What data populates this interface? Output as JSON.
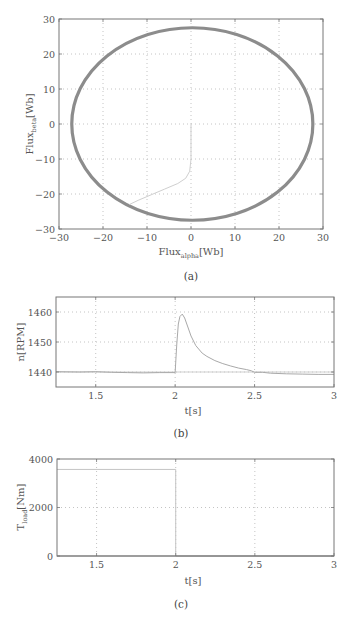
{
  "chart_data": [
    {
      "id": "a",
      "type": "line",
      "subplot_label": "(a)",
      "title": "",
      "xlabel": "Flux",
      "xlabel_sub": "alpha",
      "xlabel_unit": "[Wb]",
      "ylabel": "Flux",
      "ylabel_sub": "beta",
      "ylabel_unit": "[Wb]",
      "xlim": [
        -30,
        30
      ],
      "ylim": [
        -30,
        30
      ],
      "xticks": [
        -30,
        -20,
        -10,
        0,
        10,
        20,
        30
      ],
      "yticks": [
        -30,
        -20,
        -10,
        0,
        10,
        20,
        30
      ],
      "grid": true,
      "series": [
        {
          "name": "steady-state flux circle",
          "kind": "ellipse",
          "center": [
            0.3,
            0
          ],
          "radius_x": 27.4,
          "radius_y": 27.5,
          "color": "#8c8c8c",
          "width": 3.2
        },
        {
          "name": "startup flux trajectory",
          "kind": "polyline",
          "x": [
            0,
            0,
            -0.3,
            -1.2,
            -3,
            -6,
            -9,
            -12,
            -14
          ],
          "y": [
            0,
            -10,
            -13.5,
            -15.5,
            -17,
            -18.6,
            -20.2,
            -21.8,
            -23
          ],
          "color": "#cfcfcf",
          "width": 1
        }
      ]
    },
    {
      "id": "b",
      "type": "line",
      "subplot_label": "(b)",
      "title": "",
      "xlabel": "t[s]",
      "ylabel": "n[RPM]",
      "xlim": [
        1.25,
        3
      ],
      "ylim": [
        1435,
        1465
      ],
      "xticks": [
        1.5,
        2,
        2.5,
        3
      ],
      "yticks": [
        1440,
        1450,
        1460
      ],
      "grid": true,
      "series": [
        {
          "name": "reference speed",
          "x": [
            1.25,
            3
          ],
          "y": [
            1440,
            1440
          ],
          "color": "#cfcfcf",
          "width": 1
        },
        {
          "name": "measured speed",
          "x": [
            1.25,
            1.4,
            1.5,
            1.6,
            1.7,
            1.8,
            1.9,
            2.0,
            2.01,
            2.02,
            2.03,
            2.045,
            2.06,
            2.08,
            2.1,
            2.13,
            2.17,
            2.2,
            2.25,
            2.3,
            2.35,
            2.4,
            2.45,
            2.48,
            2.5,
            2.55,
            2.6,
            2.7,
            2.8,
            2.9,
            3.0
          ],
          "y": [
            1440.1,
            1440,
            1440.1,
            1439.9,
            1439.8,
            1439.7,
            1439.8,
            1439.8,
            1449,
            1456,
            1458.5,
            1459.3,
            1458,
            1455,
            1452,
            1448.8,
            1446.3,
            1445.2,
            1443.8,
            1442.8,
            1442,
            1441.3,
            1440.8,
            1440.4,
            1439.9,
            1439.9,
            1439.6,
            1439.4,
            1439.3,
            1439.2,
            1439.2
          ],
          "color": "#a9a9a9",
          "width": 1
        }
      ]
    },
    {
      "id": "c",
      "type": "line",
      "subplot_label": "(c)",
      "title": "",
      "xlabel": "t[s]",
      "ylabel": "T",
      "ylabel_sub": "load",
      "ylabel_unit": "[Nm]",
      "xlim": [
        1.25,
        3
      ],
      "ylim": [
        0,
        4000
      ],
      "xticks": [
        1.5,
        2,
        2.5,
        3
      ],
      "yticks": [
        0,
        2000,
        4000
      ],
      "grid": true,
      "series": [
        {
          "name": "load torque",
          "x": [
            1.25,
            2.0,
            2.0,
            3.0
          ],
          "y": [
            3570,
            3570,
            0,
            0
          ],
          "color": "#c4c4c4",
          "width": 1
        },
        {
          "name": "load torque (zero trace)",
          "x": [
            1.25,
            3.0
          ],
          "y": [
            0,
            0
          ],
          "color": "#8a8a8a",
          "width": 1.2
        }
      ]
    }
  ],
  "captions": {
    "a": "(a)",
    "b": "(b)",
    "c": "(c)"
  }
}
